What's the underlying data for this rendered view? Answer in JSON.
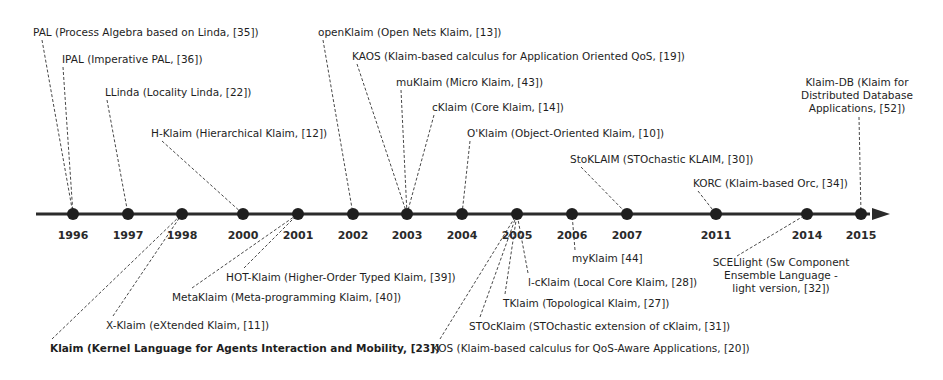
{
  "diagram": {
    "type": "timeline",
    "axis": {
      "y": 214,
      "x_start": 36,
      "x_end": 876,
      "color": "#2b2b2b"
    },
    "years": [
      {
        "label": "1996",
        "x": 73
      },
      {
        "label": "1997",
        "x": 128
      },
      {
        "label": "1998",
        "x": 182
      },
      {
        "label": "2000",
        "x": 243
      },
      {
        "label": "2001",
        "x": 298
      },
      {
        "label": "2002",
        "x": 353
      },
      {
        "label": "2003",
        "x": 407
      },
      {
        "label": "2004",
        "x": 462
      },
      {
        "label": "2005",
        "x": 517
      },
      {
        "label": "2006",
        "x": 572
      },
      {
        "label": "2007",
        "x": 627
      },
      {
        "label": "2011",
        "x": 716
      },
      {
        "label": "2014",
        "x": 807
      },
      {
        "label": "2015",
        "x": 861
      }
    ],
    "events": [
      {
        "year": "1996",
        "lines": [
          "PAL (Process Algebra based on Linda, [35])"
        ],
        "tx": 33,
        "ty": 36,
        "anchor": "start",
        "lx": 42,
        "ly": 40,
        "bold": false
      },
      {
        "year": "1996",
        "lines": [
          "IPAL (Imperative PAL, [36])"
        ],
        "tx": 62,
        "ty": 63,
        "anchor": "start",
        "lx": 63,
        "ly": 67,
        "bold": false
      },
      {
        "year": "1997",
        "lines": [
          "LLinda (Locality Linda, [22])"
        ],
        "tx": 105,
        "ty": 96,
        "anchor": "start",
        "lx": 107,
        "ly": 100,
        "bold": false
      },
      {
        "year": "2000",
        "lines": [
          "H-Klaim (Hierarchical Klaim, [12])"
        ],
        "tx": 151,
        "ty": 137,
        "anchor": "start",
        "lx": 162,
        "ly": 141,
        "bold": false
      },
      {
        "year": "2002",
        "lines": [
          "openKlaim (Open Nets Klaim, [13])"
        ],
        "tx": 318,
        "ty": 36,
        "anchor": "start",
        "lx": 323,
        "ly": 40,
        "bold": false
      },
      {
        "year": "2003",
        "lines": [
          "KAOS (Klaim-based calculus for Application Oriented QoS, [19])"
        ],
        "tx": 352,
        "ty": 60,
        "anchor": "start",
        "lx": 357,
        "ly": 64,
        "bold": false
      },
      {
        "year": "2003",
        "lines": [
          "muKlaim (Micro Klaim, [43])"
        ],
        "tx": 396,
        "ty": 86,
        "anchor": "start",
        "lx": 401,
        "ly": 90,
        "bold": false
      },
      {
        "year": "2003",
        "lines": [
          "cKlaim (Core Klaim, [14])"
        ],
        "tx": 432,
        "ty": 111,
        "anchor": "start",
        "lx": 434,
        "ly": 115,
        "bold": false
      },
      {
        "year": "2004",
        "lines": [
          "O'Klaim (Object-Oriented Klaim, [10])"
        ],
        "tx": 467,
        "ty": 137,
        "anchor": "start",
        "lx": 470,
        "ly": 141,
        "bold": false
      },
      {
        "year": "2007",
        "lines": [
          "StoKLAIM (STOchastic KLAIM, [30])"
        ],
        "tx": 570,
        "ty": 163,
        "anchor": "start",
        "lx": 581,
        "ly": 167,
        "bold": false
      },
      {
        "year": "2011",
        "lines": [
          "KORC (Klaim-based Orc, [34])"
        ],
        "tx": 693,
        "ty": 187,
        "anchor": "start",
        "lx": 698,
        "ly": 191,
        "bold": false
      },
      {
        "year": "2015",
        "lines": [
          "Klaim-DB (Klaim for",
          "Distributed Database",
          "Applications, [52])"
        ],
        "tx": 857,
        "ty": 86,
        "anchor": "middle",
        "lx": 859,
        "ly": 117,
        "bold": false
      },
      {
        "year": "1998",
        "lines": [
          "Klaim (Kernel Language for Agents Interaction and Mobility, [23])"
        ],
        "tx": 50,
        "ty": 352,
        "anchor": "start",
        "lx": 52,
        "ly": 339,
        "bold": true
      },
      {
        "year": "1998",
        "lines": [
          "X-Klaim (eXtended Klaim, [11])"
        ],
        "tx": 106,
        "ty": 329,
        "anchor": "start",
        "lx": 113,
        "ly": 316,
        "bold": false
      },
      {
        "year": "2001",
        "lines": [
          "MetaKlaim (Meta-programming Klaim, [40])"
        ],
        "tx": 172,
        "ty": 301,
        "anchor": "start",
        "lx": 192,
        "ly": 288,
        "bold": false
      },
      {
        "year": "2001",
        "lines": [
          "HOT-Klaim (Higher-Order Typed Klaim, [39])"
        ],
        "tx": 226,
        "ty": 281,
        "anchor": "start",
        "lx": 244,
        "ly": 268,
        "bold": false
      },
      {
        "year": "2005",
        "lines": [
          "KOS (Klaim-based calculus for QoS-Aware Applications, [20])"
        ],
        "tx": 432,
        "ty": 352,
        "anchor": "start",
        "lx": 440,
        "ly": 339,
        "bold": false
      },
      {
        "year": "2005",
        "lines": [
          "STOcKlaim (STOchastic extension of cKlaim, [31])"
        ],
        "tx": 469,
        "ty": 330,
        "anchor": "start",
        "lx": 480,
        "ly": 317,
        "bold": false
      },
      {
        "year": "2005",
        "lines": [
          "TKlaim (Topological Klaim, [27])"
        ],
        "tx": 503,
        "ty": 307,
        "anchor": "start",
        "lx": 505,
        "ly": 294,
        "bold": false
      },
      {
        "year": "2005",
        "lines": [
          "l-cKlaim (Local Core Klaim, [28])"
        ],
        "tx": 528,
        "ty": 286,
        "anchor": "start",
        "lx": 528,
        "ly": 273,
        "bold": false
      },
      {
        "year": "2006",
        "lines": [
          "myKlaim [44]"
        ],
        "tx": 572,
        "ty": 262,
        "anchor": "start",
        "lx": 575,
        "ly": 250,
        "bold": false
      },
      {
        "year": "2014",
        "lines": [
          "SCELlight (Sw Component",
          "Ensemble Language -",
          "light version, [32])"
        ],
        "tx": 781,
        "ty": 266,
        "anchor": "middle",
        "lx": 737,
        "ly": 256,
        "bold": false
      }
    ]
  }
}
